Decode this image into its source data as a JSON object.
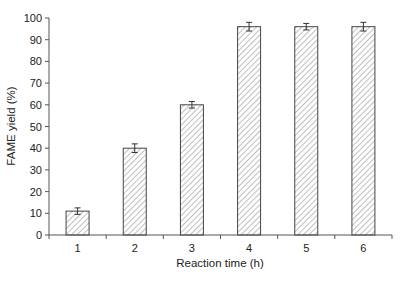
{
  "chart_data": {
    "type": "bar",
    "title": "",
    "xlabel": "Reaction time (h)",
    "ylabel": "FAME yield (%)",
    "categories": [
      "1",
      "2",
      "3",
      "4",
      "5",
      "6"
    ],
    "values": [
      11,
      40,
      60,
      96,
      96,
      96
    ],
    "errors": [
      1.5,
      2,
      1.5,
      2,
      1.5,
      2
    ],
    "ylim": [
      0,
      100
    ],
    "yticks": [
      0,
      10,
      20,
      30,
      40,
      50,
      60,
      70,
      80,
      90,
      100
    ],
    "grid": false,
    "legend": null,
    "bar_fill": "hatched diagonal lines",
    "colors": {
      "bar_edge": "#444444",
      "hatch": "#8a8a8a",
      "axis": "#555555"
    }
  }
}
